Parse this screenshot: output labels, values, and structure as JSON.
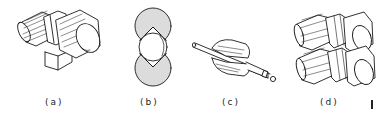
{
  "figure": {
    "panels": [
      {
        "id": "a",
        "label": "(a)",
        "description": "Single grooved cylindrical roller on a mounting block"
      },
      {
        "id": "b",
        "label": "(b)",
        "description": "End view: two shaded rolls with V-notches gripping a round workpiece"
      },
      {
        "id": "c",
        "label": "(c)",
        "description": "Split grooved die around a rod with a ball at its end"
      },
      {
        "id": "d",
        "label": "(d)",
        "description": "Pair of stacked grooved rollers"
      }
    ],
    "edge_mark": "I",
    "colors": {
      "line": "#1a1a1a",
      "shade": "#dcdcdc",
      "background": "#ffffff"
    }
  }
}
